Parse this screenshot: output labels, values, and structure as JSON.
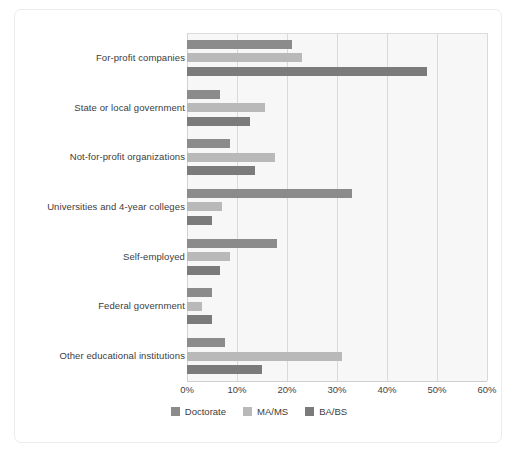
{
  "chart_data": {
    "type": "bar",
    "orientation": "horizontal",
    "title": "",
    "subtitle": "",
    "xlabel": "",
    "ylabel": "",
    "xlim": [
      0,
      60
    ],
    "xunit": "%",
    "xticks": [
      "0%",
      "10%",
      "20%",
      "30%",
      "40%",
      "50%",
      "60%"
    ],
    "xtick_values": [
      0,
      10,
      20,
      30,
      40,
      50,
      60
    ],
    "grid": true,
    "grid_axis": "x",
    "legend_position": "bottom-center",
    "categories": [
      "For-profit companies",
      "State or local government",
      "Not-for-profit organizations",
      "Universities and 4-year colleges",
      "Self-employed",
      "Federal government",
      "Other educational institutions"
    ],
    "series": [
      {
        "name": "Doctorate",
        "color": "#8b8b8b",
        "values": [
          21,
          6.5,
          8.5,
          33,
          18,
          5,
          7.5
        ]
      },
      {
        "name": "MA/MS",
        "color": "#b9b9b9",
        "values": [
          23,
          15.5,
          17.5,
          7,
          8.5,
          3,
          31
        ]
      },
      {
        "name": "BA/BS",
        "color": "#7b7b7b",
        "values": [
          48,
          12.5,
          13.5,
          5,
          6.5,
          5,
          15
        ]
      }
    ]
  },
  "legend": {
    "items": [
      {
        "label": "Doctorate",
        "color": "#8b8b8b"
      },
      {
        "label": "MA/MS",
        "color": "#b9b9b9"
      },
      {
        "label": "BA/BS",
        "color": "#7b7b7b"
      }
    ]
  },
  "style": {
    "card_background": "#ffffff",
    "card_border": "#ececec",
    "plot_background": "#f7f7f7",
    "gridline_color": "#d9d9d9",
    "text_color": "#3c3c3c"
  }
}
